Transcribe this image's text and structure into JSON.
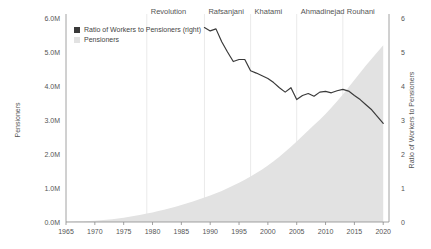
{
  "chart_data": {
    "type": "area",
    "title": "",
    "xlabel": "",
    "ylabel": "Pensioners",
    "y2label": "Ratio of Workers to Pensioners",
    "xlim": [
      1965,
      2021
    ],
    "ylim": [
      0,
      6000000
    ],
    "y2lim": [
      0,
      6
    ],
    "grid": false,
    "legend_position": "top-left",
    "x_ticks": [
      "1965",
      "1970",
      "1975",
      "1980",
      "1985",
      "1990",
      "1995",
      "2000",
      "2005",
      "2010",
      "2015",
      "2020"
    ],
    "x_tick_values": [
      1965,
      1970,
      1975,
      1980,
      1985,
      1990,
      1995,
      2000,
      2005,
      2010,
      2015,
      2020
    ],
    "y_ticks": [
      "0.0M",
      "1.0M",
      "2.0M",
      "3.0M",
      "4.0M",
      "5.0M",
      "6.0M"
    ],
    "y_tick_values": [
      0,
      1000000,
      2000000,
      3000000,
      4000000,
      5000000,
      6000000
    ],
    "y2_ticks": [
      "0",
      "1",
      "2",
      "3",
      "4",
      "5",
      "6"
    ],
    "y2_tick_values": [
      0,
      1,
      2,
      3,
      4,
      5,
      6
    ],
    "legend": [
      {
        "label": "Ratio of Workers to Pensioners (right)",
        "color": "#3a3a3a",
        "marker": "square"
      },
      {
        "label": "Pensioners",
        "color": "#e2e2e2",
        "marker": "square"
      }
    ],
    "annotations": [
      {
        "label": "Revolution",
        "x": 1979
      },
      {
        "label": "Rafsanjani",
        "x": 1989
      },
      {
        "label": "Khatami",
        "x": 1997
      },
      {
        "label": "Ahmadinejad",
        "x": 2005
      },
      {
        "label": "Rouhani",
        "x": 2013
      }
    ],
    "series": [
      {
        "name": "Pensioners",
        "axis": "left",
        "type": "area",
        "x": [
          1965,
          1966,
          1967,
          1968,
          1969,
          1970,
          1971,
          1972,
          1973,
          1974,
          1975,
          1976,
          1977,
          1978,
          1979,
          1980,
          1981,
          1982,
          1983,
          1984,
          1985,
          1986,
          1987,
          1988,
          1989,
          1990,
          1991,
          1992,
          1993,
          1994,
          1995,
          1996,
          1997,
          1998,
          1999,
          2000,
          2001,
          2002,
          2003,
          2004,
          2005,
          2006,
          2007,
          2008,
          2009,
          2010,
          2011,
          2012,
          2013,
          2014,
          2015,
          2016,
          2017,
          2018,
          2019,
          2020
        ],
        "values": [
          10000,
          14000,
          19000,
          25000,
          32000,
          40000,
          52000,
          66000,
          83000,
          103000,
          126000,
          152000,
          181000,
          213000,
          247000,
          283000,
          322000,
          363000,
          406000,
          452000,
          500000,
          551000,
          604000,
          660000,
          718000,
          779000,
          845000,
          915000,
          990000,
          1070000,
          1155000,
          1245000,
          1340000,
          1440000,
          1545000,
          1660000,
          1785000,
          1920000,
          2065000,
          2215000,
          2370000,
          2530000,
          2690000,
          2850000,
          3010000,
          3180000,
          3360000,
          3550000,
          3750000,
          3960000,
          4180000,
          4390000,
          4600000,
          4800000,
          5000000,
          5200000
        ]
      },
      {
        "name": "Ratio of Workers to Pensioners (right)",
        "axis": "right",
        "type": "line",
        "x": [
          1989,
          1990,
          1991,
          1992,
          1993,
          1994,
          1995,
          1996,
          1997,
          1998,
          1999,
          2000,
          2001,
          2002,
          2003,
          2004,
          2005,
          2006,
          2007,
          2008,
          2009,
          2010,
          2011,
          2012,
          2013,
          2014,
          2015,
          2016,
          2017,
          2018,
          2019,
          2020
        ],
        "values": [
          5.72,
          5.62,
          5.68,
          5.3,
          5.0,
          4.72,
          4.78,
          4.78,
          4.45,
          4.38,
          4.3,
          4.22,
          4.1,
          3.95,
          3.82,
          3.95,
          3.6,
          3.72,
          3.78,
          3.7,
          3.82,
          3.84,
          3.8,
          3.86,
          3.9,
          3.85,
          3.72,
          3.6,
          3.45,
          3.3,
          3.1,
          2.9
        ]
      }
    ]
  }
}
